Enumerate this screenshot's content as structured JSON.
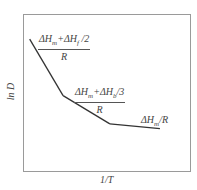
{
  "chart_data": {
    "type": "line",
    "title": "",
    "xlabel": "1/T",
    "ylabel": "ln D",
    "grid": false,
    "series": [
      {
        "name": "ln D vs 1/T",
        "x": [
          0.04,
          0.24,
          0.52,
          0.82
        ],
        "y": [
          0.84,
          0.48,
          0.3,
          0.27
        ]
      }
    ],
    "xlim": [
      0,
      1
    ],
    "ylim": [
      0,
      1
    ],
    "annotations": [
      {
        "segment": 1,
        "numerator": "ΔHm+ΔHf /2",
        "denominator": "R"
      },
      {
        "segment": 2,
        "numerator": "ΔHm+ΔHb/3",
        "denominator": "R"
      },
      {
        "segment": 3,
        "text": "ΔHm/R"
      }
    ]
  },
  "labels": {
    "xlabel": "1/T",
    "ylabel": "ln D",
    "seg1_num": "ΔH",
    "seg1_num_sub1": "m",
    "seg1_num_mid": "+ΔH",
    "seg1_num_sub2": "f",
    "seg1_num_tail": " /2",
    "seg1_den": "R",
    "seg2_num": "ΔH",
    "seg2_num_sub1": "m",
    "seg2_num_mid": "+ΔH",
    "seg2_num_sub2": "b",
    "seg2_num_tail": "/3",
    "seg2_den": "R",
    "seg3_a": "ΔH",
    "seg3_sub": "m",
    "seg3_b": "/R"
  }
}
